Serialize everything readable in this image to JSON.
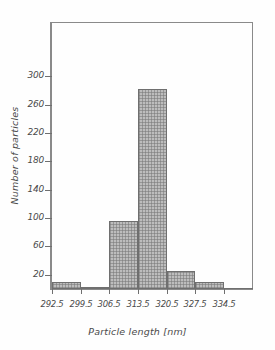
{
  "chart_data": {
    "type": "bar",
    "title": "",
    "subtitle": "",
    "xlabel": "Particle length [nm]",
    "ylabel": "Number of particles",
    "categories": [
      "292.5",
      "299.5",
      "306.5",
      "313.5",
      "320.5",
      "327.5"
    ],
    "bin_edges": [
      292.5,
      299.5,
      306.5,
      313.5,
      320.5,
      327.5,
      334.5
    ],
    "bin_width": 7,
    "values": [
      10,
      2,
      96,
      282,
      25,
      10
    ],
    "xlim": [
      292.5,
      334.5
    ],
    "ylim": [
      0,
      320
    ],
    "xticks": [
      "292.5",
      "299.5",
      "306.5",
      "313.5",
      "320.5",
      "327.5",
      "334.5"
    ],
    "yticks": [
      "20",
      "60",
      "100",
      "140",
      "180",
      "220",
      "260",
      "300"
    ],
    "ytick_values": [
      20,
      60,
      100,
      140,
      180,
      220,
      260,
      300
    ],
    "grid": false,
    "legend": null,
    "legend_position": "none",
    "annotations": [],
    "bar_fill_color": "#bdbdbd",
    "bar_edge_color": "#6f6f6f",
    "axis_color": "#6f6f6f",
    "frame_color": "#8a8a8a",
    "text_color": "#4a4a4a",
    "background_color": "#fefefe"
  }
}
